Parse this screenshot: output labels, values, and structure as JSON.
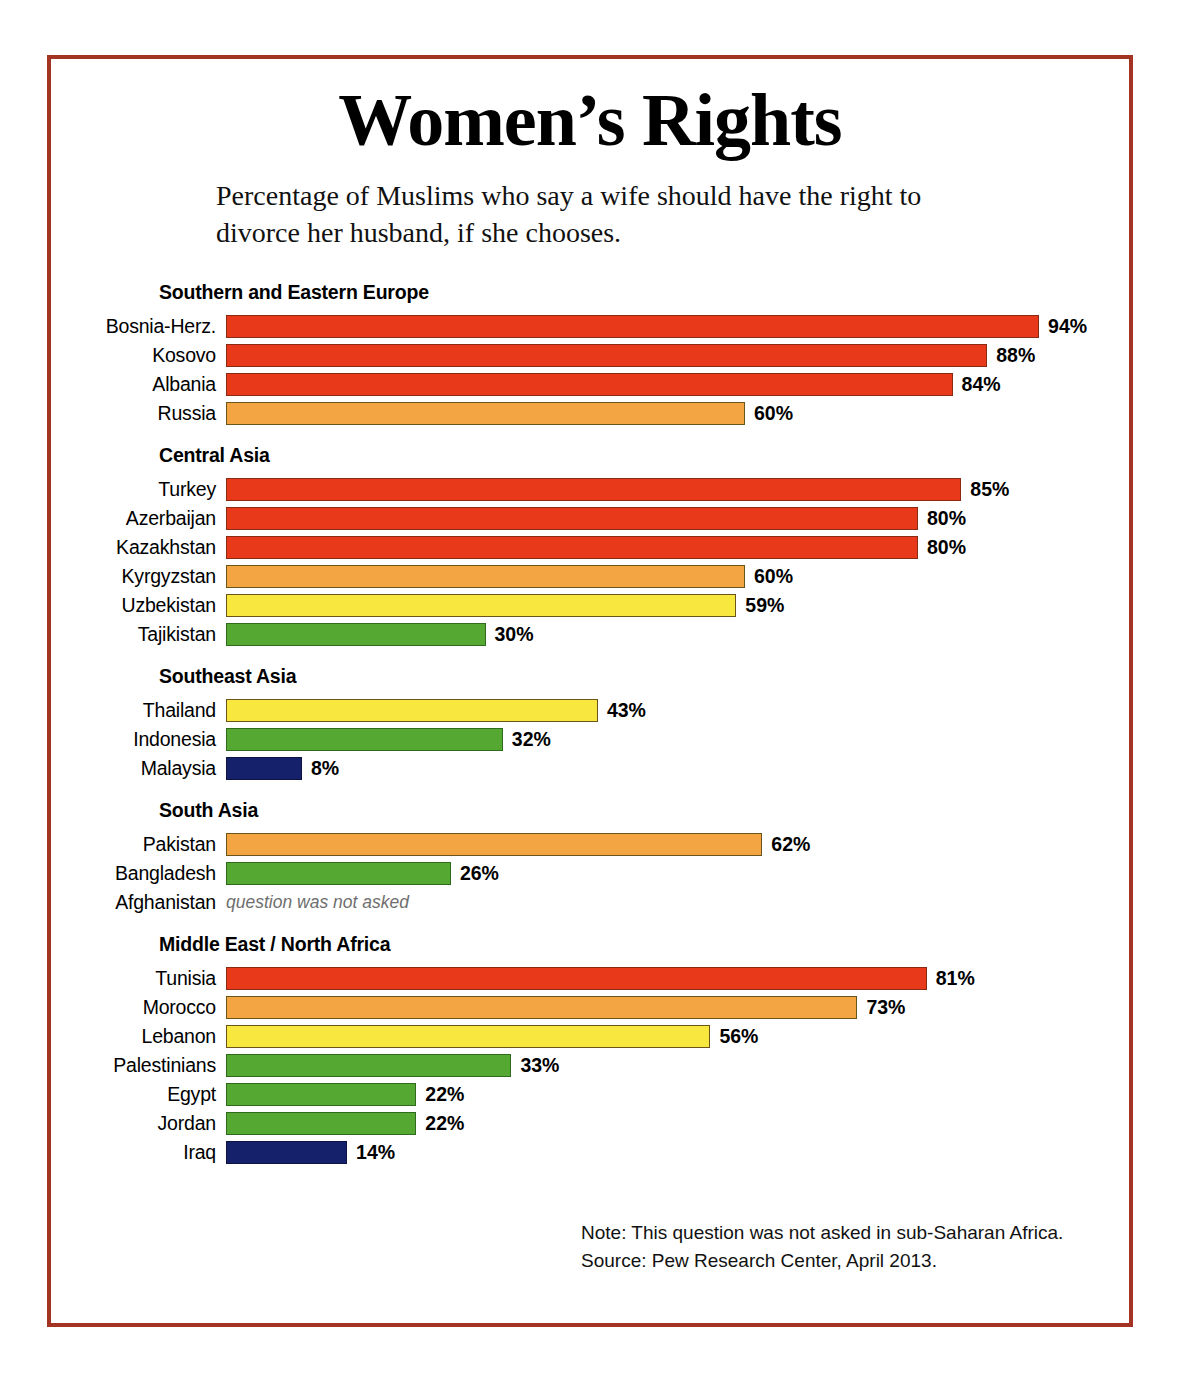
{
  "poster": {
    "title": "Women’s Rights",
    "subtitle": "Percentage of Muslims who say a wife should have the right to divorce her husband, if she chooses.",
    "frame_color": "#A33322"
  },
  "footnotes": {
    "note": "Note: This question was not asked in sub-Saharan Africa.",
    "source": "Source: Pew Research Center, April 2013."
  },
  "palette": {
    "red": "#E8391B",
    "orange": "#F3A543",
    "yellow": "#F7E73E",
    "green": "#55A832",
    "navy": "#16216B"
  },
  "chart_data": {
    "type": "bar",
    "orientation": "horizontal",
    "title": "Women’s Rights",
    "subtitle": "Percentage of Muslims who say a wife should have the right to divorce her husband, if she chooses.",
    "xlabel": "",
    "ylabel": "",
    "xlim": [
      0,
      100
    ],
    "grid": false,
    "legend": "none",
    "value_suffix": "%",
    "note": "Note: This question was not asked in sub-Saharan Africa.",
    "source": "Source: Pew Research Center, April 2013.",
    "groups": [
      {
        "name": "Southern and Eastern Europe",
        "rows": [
          {
            "label": "Bosnia-Herz.",
            "value": 94,
            "display": "94%",
            "color": "red"
          },
          {
            "label": "Kosovo",
            "value": 88,
            "display": "88%",
            "color": "red"
          },
          {
            "label": "Albania",
            "value": 84,
            "display": "84%",
            "color": "red"
          },
          {
            "label": "Russia",
            "value": 60,
            "display": "60%",
            "color": "orange"
          }
        ]
      },
      {
        "name": "Central Asia",
        "rows": [
          {
            "label": "Turkey",
            "value": 85,
            "display": "85%",
            "color": "red"
          },
          {
            "label": "Azerbaijan",
            "value": 80,
            "display": "80%",
            "color": "red"
          },
          {
            "label": "Kazakhstan",
            "value": 80,
            "display": "80%",
            "color": "red"
          },
          {
            "label": "Kyrgyzstan",
            "value": 60,
            "display": "60%",
            "color": "orange"
          },
          {
            "label": "Uzbekistan",
            "value": 59,
            "display": "59%",
            "color": "yellow"
          },
          {
            "label": "Tajikistan",
            "value": 30,
            "display": "30%",
            "color": "green"
          }
        ]
      },
      {
        "name": "Southeast Asia",
        "rows": [
          {
            "label": "Thailand",
            "value": 43,
            "display": "43%",
            "color": "yellow"
          },
          {
            "label": "Indonesia",
            "value": 32,
            "display": "32%",
            "color": "green"
          },
          {
            "label": "Malaysia",
            "value": 8,
            "display": "8%",
            "color": "navy"
          }
        ]
      },
      {
        "name": "South Asia",
        "rows": [
          {
            "label": "Pakistan",
            "value": 62,
            "display": "62%",
            "color": "orange"
          },
          {
            "label": "Bangladesh",
            "value": 26,
            "display": "26%",
            "color": "green"
          },
          {
            "label": "Afghanistan",
            "value": null,
            "display": "question was not asked",
            "color": null
          }
        ]
      },
      {
        "name": "Middle East / North Africa",
        "rows": [
          {
            "label": "Tunisia",
            "value": 81,
            "display": "81%",
            "color": "red"
          },
          {
            "label": "Morocco",
            "value": 73,
            "display": "73%",
            "color": "orange"
          },
          {
            "label": "Lebanon",
            "value": 56,
            "display": "56%",
            "color": "yellow"
          },
          {
            "label": "Palestinians",
            "value": 33,
            "display": "33%",
            "color": "green"
          },
          {
            "label": "Egypt",
            "value": 22,
            "display": "22%",
            "color": "green"
          },
          {
            "label": "Jordan",
            "value": 22,
            "display": "22%",
            "color": "green"
          },
          {
            "label": "Iraq",
            "value": 14,
            "display": "14%",
            "color": "navy"
          }
        ]
      }
    ]
  }
}
